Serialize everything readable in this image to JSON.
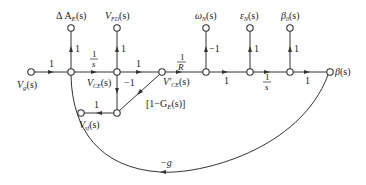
{
  "diagram": {
    "type": "signal-flow-graph",
    "nodes": {
      "input": "V̇g(s)",
      "delta_ae": "ΔAₑ(s)",
      "vfd": "VₑD(s)",
      "vce": "Vₒₑ(s)",
      "vce_prime": "V'ₒₑ(s)",
      "vsf": "Vₛₑ(s)",
      "omega_n": "ωN(s)",
      "eps_n": "εN(s)",
      "beta0": "β0(s)",
      "beta": "β(s)"
    },
    "labels": {
      "vg": "V",
      "vg_sub": "g",
      "delta_ae": "Δ A",
      "delta_ae_sub": "E",
      "vfd": "V",
      "vfd_sub": "FD",
      "vce": "V",
      "vce_sub": "CE",
      "vce_prime": "V'",
      "vce_prime_sub": "CE",
      "vsf": "V",
      "vsf_sub": "sf",
      "omega": "ω",
      "omega_sub": "N",
      "eps": "ε",
      "eps_sub": "N",
      "beta0": "β",
      "beta0_sub": "0",
      "beta": "β",
      "arg": "(s)"
    },
    "gains": {
      "vg_to_a": "1",
      "a_to_delta": "1",
      "a_to_vce_num": "1",
      "a_to_vce_den": "s",
      "vce_to_vfd": "1",
      "vce_to_vceprime": "1",
      "vce_down": "−1",
      "vceprime_to_d_num": "1",
      "vceprime_to_d_den": "R",
      "d_to_omega": "−1",
      "d_to_e": "1",
      "e_to_eps": "1",
      "e_to_f_num": "1",
      "e_to_f_den": "s",
      "f_to_beta0": "1",
      "f_to_beta": "1",
      "i_to_h": "1",
      "feedback_ge": "[1−G",
      "feedback_ge_sub": "E",
      "feedback_ge_end": "(s)]",
      "feedback_g": "−g"
    }
  }
}
